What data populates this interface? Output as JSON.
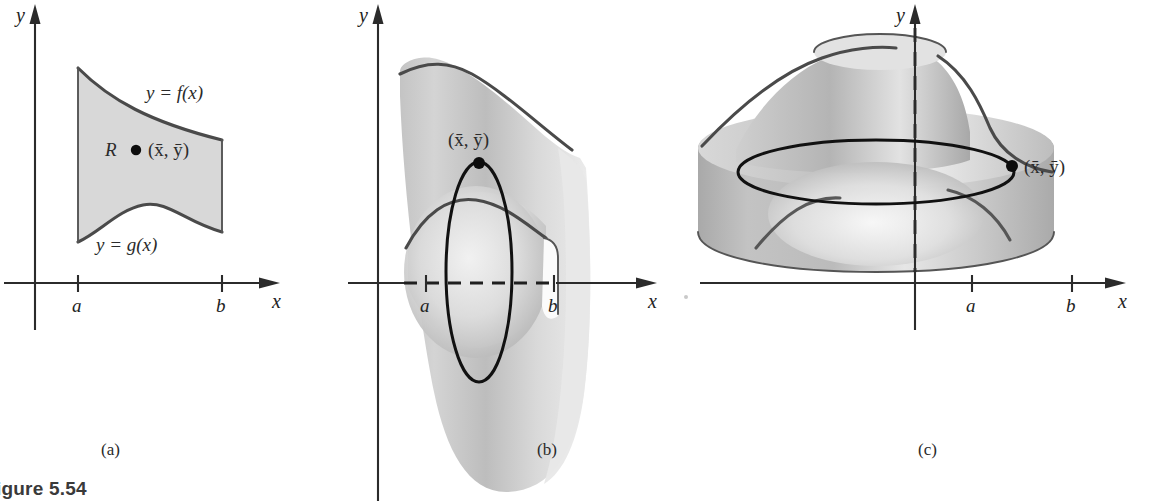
{
  "figure": {
    "caption": "igure 5.54",
    "caption_full": "Figure 5.54",
    "domain": "mathematical-diagram"
  },
  "colors": {
    "ink": "#2b2b2b",
    "region_fill": "#d8d8d8",
    "curve": "#4a4a4a",
    "solid_light": "#e4e4e4",
    "solid_mid": "#c7c7c7",
    "solid_dark": "#a6a6a6",
    "accent_black": "#0d0d0d",
    "background": "#ffffff"
  },
  "panels": [
    {
      "id": "a",
      "caption": "(a)",
      "axes": {
        "x_label": "x",
        "y_label": "y"
      },
      "ticks": [
        {
          "name": "a",
          "label": "a"
        },
        {
          "name": "b",
          "label": "b"
        }
      ],
      "labels": {
        "upper_curve": "y = f(x)",
        "lower_curve": "y = g(x)",
        "region": "R",
        "centroid": "(x̄, ȳ)"
      }
    },
    {
      "id": "b",
      "caption": "(b)",
      "axes": {
        "x_label": "x",
        "y_label": "y"
      },
      "ticks": [
        {
          "name": "a",
          "label": "a"
        },
        {
          "name": "b",
          "label": "b"
        }
      ],
      "labels": {
        "centroid": "(x̄, ȳ)"
      },
      "revolution_axis": "x-axis"
    },
    {
      "id": "c",
      "caption": "(c)",
      "axes": {
        "x_label": "x",
        "y_label": "y"
      },
      "ticks": [
        {
          "name": "a",
          "label": "a"
        },
        {
          "name": "b",
          "label": "b"
        }
      ],
      "labels": {
        "centroid": "(x̄, ȳ)"
      },
      "revolution_axis": "y-axis"
    }
  ]
}
